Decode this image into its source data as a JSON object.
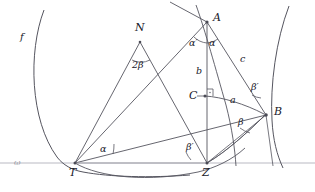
{
  "figure": {
    "width": 315,
    "height": 192,
    "colors": {
      "stroke": "#4a4a55",
      "baseline": "#b9b9c2",
      "text": "#20202a",
      "faint_text": "#9a9aa4",
      "background": "#ffffff"
    }
  },
  "points": {
    "A": {
      "label": "A",
      "x": 207,
      "y": 22,
      "lx": 213,
      "ly": 17
    },
    "B": {
      "label": "B",
      "x": 266,
      "y": 115,
      "lx": 274,
      "ly": 111
    },
    "C": {
      "label": "C",
      "x": 205,
      "y": 96,
      "lx": 191,
      "ly": 92
    },
    "N": {
      "label": "N",
      "x": 140,
      "y": 42,
      "lx": 135,
      "ly": 25
    },
    "T": {
      "label": "T",
      "x": 75,
      "y": 163,
      "lx": 70,
      "ly": 170
    },
    "Z": {
      "label": "Z",
      "x": 207,
      "y": 163,
      "lx": 203,
      "ly": 170
    }
  },
  "sides": [
    {
      "name": "b",
      "label": "b",
      "lx": 197,
      "ly": 72
    },
    {
      "name": "c",
      "label": "c",
      "lx": 241,
      "ly": 60
    },
    {
      "name": "a",
      "label": "a",
      "lx": 231,
      "ly": 100
    }
  ],
  "angles": [
    {
      "name": "alpha-at-A",
      "label": "α",
      "lx": 210,
      "ly": 44
    },
    {
      "name": "alpha-prime-at-A",
      "label": "α′",
      "lx": 192,
      "ly": 44
    },
    {
      "name": "two-beta-at-N",
      "label": "2β",
      "lx": 134,
      "ly": 66
    },
    {
      "name": "alpha-at-T",
      "label": "α",
      "lx": 102,
      "ly": 150
    },
    {
      "name": "beta-prime-at-Z",
      "label": "β′",
      "lx": 188,
      "ly": 148
    },
    {
      "name": "beta-at-B",
      "label": "β",
      "lx": 240,
      "ly": 123
    },
    {
      "name": "beta-prime-at-B",
      "label": "β′",
      "lx": 253,
      "ly": 88
    }
  ],
  "curves": [
    {
      "name": "circle-f",
      "label": "f",
      "lx": 22,
      "ly": 37
    }
  ],
  "axis": {
    "name": "baseline-omega",
    "label": "ω",
    "lx": 16,
    "ly": 164,
    "y": 163
  }
}
